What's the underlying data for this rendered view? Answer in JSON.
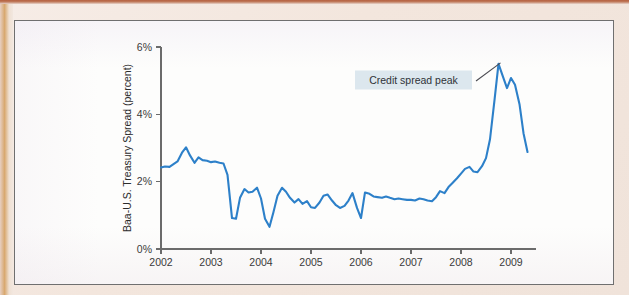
{
  "figure": {
    "line_color": "#2d80c9",
    "callout_fill": "#dce7ee",
    "callout_text_color": "#2f3338",
    "frame_color": "#6f6f6f",
    "page_margin_color": "#efe4dd"
  },
  "annotation": {
    "label": "Credit spread peak"
  },
  "axes": {
    "y_title": "Baa-U.S. Treasury Spread (percent)",
    "y_ticks": [
      "0%",
      "2%",
      "4%",
      "6%"
    ],
    "x_ticks": [
      "2002",
      "2003",
      "2004",
      "2005",
      "2006",
      "2007",
      "2008",
      "2009"
    ]
  },
  "chart_data": {
    "type": "line",
    "title": "",
    "subtitle": "",
    "xlabel": "",
    "ylabel": "Baa-U.S. Treasury Spread (percent)",
    "xlim": [
      2002.0,
      2009.5
    ],
    "ylim": [
      0,
      6
    ],
    "y_tick_values": [
      0,
      2,
      4,
      6
    ],
    "y_tick_labels": [
      "0%",
      "2%",
      "4%",
      "6%"
    ],
    "x_tick_values": [
      2002,
      2003,
      2004,
      2005,
      2006,
      2007,
      2008,
      2009
    ],
    "x_tick_labels": [
      "2002",
      "2003",
      "2004",
      "2005",
      "2006",
      "2007",
      "2008",
      "2009"
    ],
    "grid": false,
    "legend": false,
    "legend_position": "none",
    "units": "percent",
    "annotations": [
      {
        "text": "Credit spread peak",
        "points_to_x": 2008.79,
        "points_to_y": 5.5,
        "box_center_x": 2007.05,
        "box_center_y": 5.02
      }
    ],
    "series": [
      {
        "name": "Baa-U.S. Treasury spread",
        "color": "#2d80c9",
        "x": [
          2002.0,
          2002.08,
          2002.17,
          2002.25,
          2002.33,
          2002.42,
          2002.5,
          2002.58,
          2002.67,
          2002.75,
          2002.83,
          2002.92,
          2003.0,
          2003.08,
          2003.17,
          2003.25,
          2003.33,
          2003.42,
          2003.5,
          2003.58,
          2003.67,
          2003.75,
          2003.83,
          2003.92,
          2004.0,
          2004.08,
          2004.17,
          2004.25,
          2004.33,
          2004.42,
          2004.5,
          2004.58,
          2004.67,
          2004.75,
          2004.83,
          2004.92,
          2005.0,
          2005.08,
          2005.17,
          2005.25,
          2005.33,
          2005.42,
          2005.5,
          2005.58,
          2005.67,
          2005.75,
          2005.83,
          2005.92,
          2006.0,
          2006.08,
          2006.17,
          2006.25,
          2006.33,
          2006.42,
          2006.5,
          2006.58,
          2006.67,
          2006.75,
          2006.83,
          2006.92,
          2007.0,
          2007.08,
          2007.17,
          2007.25,
          2007.33,
          2007.42,
          2007.5,
          2007.58,
          2007.67,
          2007.75,
          2007.83,
          2007.92,
          2008.0,
          2008.08,
          2008.17,
          2008.25,
          2008.33,
          2008.42,
          2008.5,
          2008.58,
          2008.67,
          2008.75,
          2008.83,
          2008.92,
          2009.0,
          2009.08,
          2009.17,
          2009.25,
          2009.33
        ],
        "values": [
          2.42,
          2.45,
          2.44,
          2.52,
          2.6,
          2.86,
          3.02,
          2.78,
          2.56,
          2.72,
          2.64,
          2.62,
          2.58,
          2.6,
          2.56,
          2.54,
          2.2,
          0.92,
          0.9,
          1.52,
          1.78,
          1.68,
          1.7,
          1.82,
          1.5,
          0.9,
          0.66,
          1.1,
          1.58,
          1.82,
          1.7,
          1.52,
          1.38,
          1.48,
          1.34,
          1.42,
          1.24,
          1.22,
          1.38,
          1.58,
          1.62,
          1.44,
          1.3,
          1.22,
          1.28,
          1.44,
          1.66,
          1.22,
          0.92,
          1.68,
          1.64,
          1.56,
          1.54,
          1.52,
          1.56,
          1.52,
          1.48,
          1.5,
          1.48,
          1.46,
          1.46,
          1.44,
          1.5,
          1.48,
          1.44,
          1.42,
          1.54,
          1.72,
          1.66,
          1.84,
          1.96,
          2.1,
          2.24,
          2.38,
          2.44,
          2.3,
          2.28,
          2.46,
          2.7,
          3.26,
          4.42,
          5.5,
          5.16,
          4.78,
          5.08,
          4.88,
          4.3,
          3.44,
          2.88
        ]
      }
    ]
  }
}
